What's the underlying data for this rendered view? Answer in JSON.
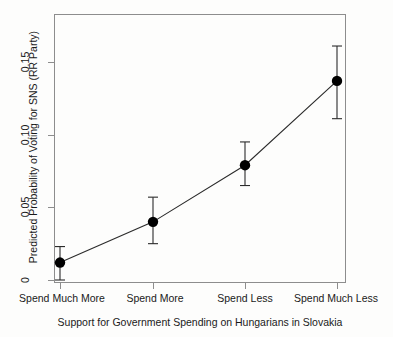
{
  "chart_data": {
    "type": "line",
    "title": "",
    "xlabel": "Support for Government Spending on Hungarians in Slovakia",
    "ylabel": "Predicted Probability of Voting for SNS (RR Party)",
    "categories": [
      "Spend Much More",
      "Spend More",
      "Spend Less",
      "Spend Much Less"
    ],
    "values": [
      0.012,
      0.04,
      0.079,
      0.137
    ],
    "error_low": [
      0.0,
      0.025,
      0.065,
      0.111
    ],
    "error_high": [
      0.023,
      0.057,
      0.095,
      0.161
    ],
    "ytick_labels": [
      "0",
      "0.05",
      "0.10",
      "0.15"
    ],
    "ytick_values": [
      0,
      0.05,
      0.1,
      0.15
    ],
    "ylim": [
      -0.008,
      0.178
    ],
    "grid": false,
    "legend": "none",
    "marker": "filled-circle",
    "series": [
      {
        "name": "Predicted Probability of Voting for SNS (RR Party)",
        "values": [
          0.012,
          0.04,
          0.079,
          0.137
        ]
      }
    ]
  },
  "axes": {
    "y_title": "Predicted Probability of Voting for SNS (RR Party)",
    "x_title": "Support for Government Spending on Hungarians in Slovakia",
    "y_ticks": [
      {
        "label": "0.15"
      },
      {
        "label": "0.10"
      },
      {
        "label": "0.05"
      },
      {
        "label": "0"
      }
    ],
    "x_ticks": [
      {
        "label": "Spend Much More"
      },
      {
        "label": "Spend More"
      },
      {
        "label": "Spend Less"
      },
      {
        "label": "Spend Much Less"
      }
    ]
  },
  "style": {
    "frame_color": "#8d8d8d",
    "marker_color": "#000000",
    "line_color": "#2b2b2b",
    "background": "#fdfdfc"
  }
}
